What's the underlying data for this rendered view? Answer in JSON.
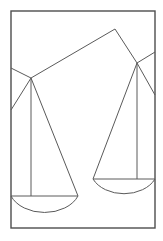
{
  "figure": {
    "canvas": {
      "width": 163,
      "height": 241
    },
    "background_color": "#ffffff",
    "stroke_color": "#5a5a5a",
    "frame_color": "#4d4d4d",
    "stroke_width": 1,
    "frame_stroke_width": 1.4
  },
  "geometry": {
    "frame": {
      "x": 11,
      "y": 11,
      "width": 144,
      "height": 217
    },
    "pivots": {
      "left": {
        "x": 31,
        "y": 78,
        "label": "left-pivot"
      },
      "right": {
        "x": 137,
        "y": 63,
        "label": "right-pivot"
      },
      "apex": {
        "x": 115,
        "y": 29,
        "label": "beam-apex"
      }
    },
    "beam": {
      "points": "11,68 31,78 115,29 137,63 155,52",
      "label": "balance-beam"
    },
    "left_assembly": {
      "hanger_left": {
        "x1": 31,
        "y1": 78,
        "x2": 11,
        "y2": 110
      },
      "hanger_center": {
        "x1": 31,
        "y1": 78,
        "x2": 31,
        "y2": 196
      },
      "hanger_right": {
        "x1": 31,
        "y1": 78,
        "x2": 78,
        "y2": 196
      },
      "pan_line": {
        "x1": 11,
        "y1": 196,
        "x2": 78,
        "y2": 196
      },
      "pan_arc": {
        "start_x": 11,
        "start_y": 196,
        "end_x": 78,
        "end_y": 196,
        "rx": 36,
        "ry": 26,
        "depth": 218
      }
    },
    "right_assembly": {
      "hanger_right": {
        "x1": 137,
        "y1": 63,
        "x2": 155,
        "y2": 95
      },
      "hanger_center": {
        "x1": 137,
        "y1": 63,
        "x2": 137,
        "y2": 179
      },
      "hanger_left": {
        "x1": 137,
        "y1": 63,
        "x2": 93,
        "y2": 179
      },
      "pan_line": {
        "x1": 93,
        "y1": 179,
        "x2": 155,
        "y2": 179
      },
      "pan_arc": {
        "start_x": 93,
        "start_y": 179,
        "end_x": 155,
        "end_y": 179,
        "rx": 34,
        "ry": 25,
        "depth": 202
      }
    }
  },
  "elements": {
    "frame_label": "outer-frame",
    "beam_label": "beam",
    "left_pan_label": "left-pan",
    "right_pan_label": "right-pan"
  }
}
